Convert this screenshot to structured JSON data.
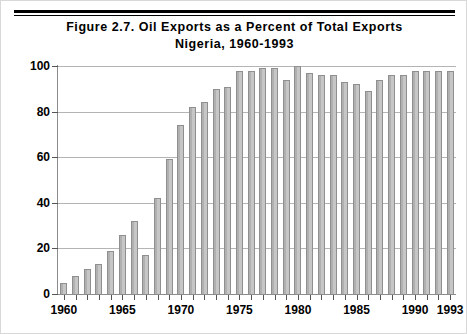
{
  "figure": {
    "title_line1": "Figure 2.7.   Oil Exports as a Percent of Total Exports",
    "title_line2": "Nigeria, 1960-1993"
  },
  "chart_data": {
    "type": "bar",
    "title": "Figure 2.7.   Oil Exports as a Percent of Total Exports Nigeria, 1960-1993",
    "subtitle": "Nigeria, 1960-1993",
    "xlabel": "",
    "ylabel": "",
    "ylim": [
      0,
      100
    ],
    "yticks": [
      0,
      20,
      40,
      60,
      80,
      100
    ],
    "ytick_labels": [
      "0",
      "20",
      "40",
      "60",
      "80",
      "100"
    ],
    "xtick_labels": [
      "1960",
      "1965",
      "1970",
      "1975",
      "1980",
      "1985",
      "1990",
      "1993"
    ],
    "xtick_years": [
      1960,
      1965,
      1970,
      1975,
      1980,
      1985,
      1990,
      1993
    ],
    "grid": true,
    "legend": "none",
    "bar_color": "#c6c6c6",
    "bar_edge_color": "#8f8f8f",
    "categories": [
      "1960",
      "1961",
      "1962",
      "1963",
      "1964",
      "1965",
      "1966",
      "1967",
      "1968",
      "1969",
      "1970",
      "1971",
      "1972",
      "1973",
      "1974",
      "1975",
      "1976",
      "1977",
      "1978",
      "1979",
      "1980",
      "1981",
      "1982",
      "1983",
      "1984",
      "1985",
      "1986",
      "1987",
      "1988",
      "1989",
      "1990",
      "1991",
      "1992",
      "1993"
    ],
    "values": [
      5,
      8,
      11,
      13,
      19,
      26,
      32,
      17,
      42,
      59,
      74,
      82,
      84,
      90,
      91,
      98,
      98,
      99,
      99,
      94,
      100,
      97,
      96,
      96,
      93,
      92,
      89,
      94,
      96,
      96,
      98,
      98,
      98,
      98
    ]
  }
}
